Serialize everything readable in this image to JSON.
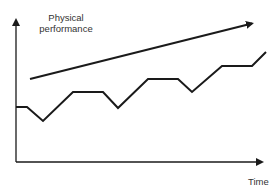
{
  "diagram": {
    "title": "",
    "y_axis": {
      "label_line1": "Physical",
      "label_line2": "performance"
    },
    "x_axis": {
      "label": "Time"
    },
    "trend_arrow": {
      "from": [
        30,
        79
      ],
      "to": [
        257,
        22
      ],
      "meaning": "upward trend"
    },
    "zigzag_points": [
      [
        16,
        107
      ],
      [
        27,
        107
      ],
      [
        43,
        121
      ],
      [
        73,
        92
      ],
      [
        103,
        92
      ],
      [
        118,
        108
      ],
      [
        148,
        79
      ],
      [
        178,
        79
      ],
      [
        192,
        92
      ],
      [
        222,
        66
      ],
      [
        252,
        66
      ],
      [
        266,
        52
      ]
    ],
    "colors": {
      "line": "#1a1a1a",
      "axis": "#1a1a1a",
      "text": "#333333"
    }
  }
}
